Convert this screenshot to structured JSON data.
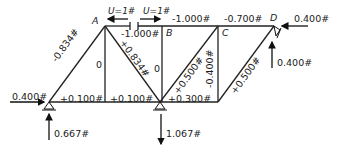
{
  "diagram": {
    "type": "truss free-body diagram",
    "joints": {
      "A": "A",
      "B": "B",
      "C": "C",
      "D": "D"
    },
    "virtual_loads": {
      "left": "U=1#",
      "right": "U=1#"
    },
    "members": {
      "top_AB": "-1.000#",
      "top_BC": "-1.000#",
      "top_CD": "-0.700#",
      "diag_left": "-0.834#",
      "diag_A_mid": "+0.834#",
      "vert_A": "0",
      "vert_B": "0",
      "diag_mid_C": "+0.500#",
      "vert_C": "-0.400#",
      "diag_right": "+0.500#",
      "bottom_1": "+0.100#",
      "bottom_2": "+0.100#",
      "bottom_3": "+0.300#"
    },
    "external_forces": {
      "left_horizontal": "0.400#",
      "left_reaction": "0.667#",
      "mid_reaction": "1.067#",
      "right_horizontal": "0.400#",
      "right_reaction": "0.400#"
    }
  }
}
